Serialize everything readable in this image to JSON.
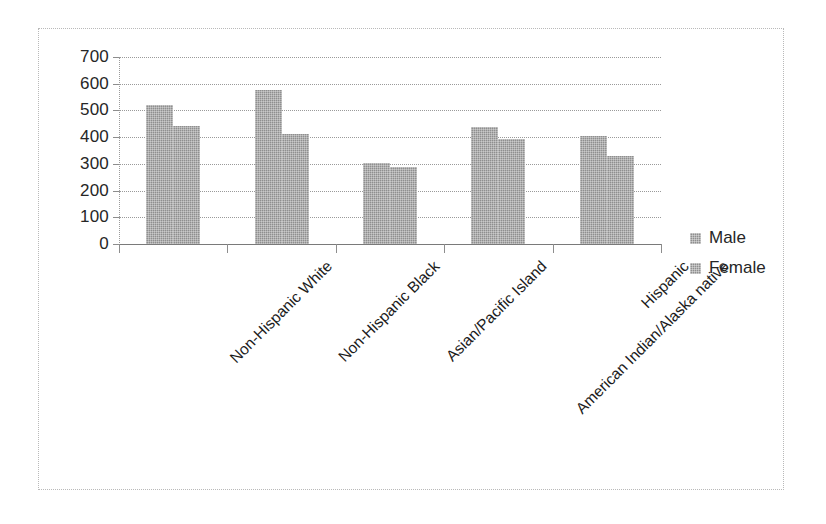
{
  "chart_data": {
    "type": "bar",
    "title": "",
    "xlabel": "",
    "ylabel": "",
    "ylim": [
      0,
      700
    ],
    "ytick_values": [
      700,
      600,
      500,
      400,
      300,
      200,
      100,
      0
    ],
    "ytick_labels": [
      "700",
      "600",
      "500",
      "400",
      "300",
      "200",
      "100",
      "0"
    ],
    "grid": true,
    "legend_position": "right",
    "bar_color": "#8f8f8f",
    "categories": [
      "Non-Hispanic White",
      "Non-Hispanic Black",
      "Asian/Pacific Island",
      "American Indian/Alaska native",
      "Hispanic"
    ],
    "series": [
      {
        "name": "Male",
        "values": [
          520,
          575,
          305,
          437,
          404
        ]
      },
      {
        "name": "Female",
        "values": [
          440,
          412,
          290,
          393,
          330
        ]
      }
    ]
  },
  "legend": {
    "items": [
      {
        "label": "Male"
      },
      {
        "label": "Female"
      }
    ]
  }
}
